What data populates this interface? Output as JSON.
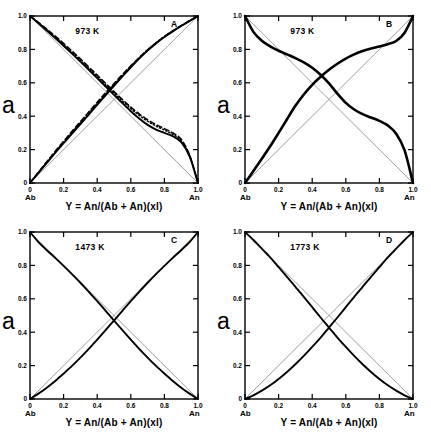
{
  "figure": {
    "background": "#ffffff",
    "axis_color": "#000000",
    "curve_color": "#000000",
    "ideal_line_color": "#888888"
  },
  "axes": {
    "y_label": "a",
    "x_title": "Y = An/(Ab + An)(xl)",
    "x_left_endmember": "Ab",
    "x_right_endmember": "An",
    "x_ticks": [
      "0",
      "0.2",
      "0.4",
      "0.6",
      "0.8",
      "1.0"
    ],
    "y_ticks": [
      "0",
      "0.2",
      "0.4",
      "0.6",
      "0.8",
      "1.0"
    ],
    "xlim": [
      0,
      1
    ],
    "ylim": [
      0,
      1
    ]
  },
  "panels": [
    {
      "id": "A",
      "label": "A",
      "temperature": "973 K"
    },
    {
      "id": "B",
      "label": "B",
      "temperature": "973 K"
    },
    {
      "id": "C",
      "label": "C",
      "temperature": "1473 K"
    },
    {
      "id": "D",
      "label": "D",
      "temperature": "1773 K"
    }
  ],
  "chart_data": [
    {
      "type": "line",
      "panel": "A",
      "title": "973 K",
      "xlabel": "Y = An/(Ab + An)(xl)",
      "ylabel": "a",
      "xlim": [
        0,
        1
      ],
      "ylim": [
        0,
        1
      ],
      "grid": false,
      "legend": "none",
      "annotations": [
        "A",
        "973 K",
        "Ab",
        "An"
      ],
      "series": [
        {
          "name": "a(An) solid",
          "style": "solid",
          "x": [
            0.0,
            0.05,
            0.1,
            0.15,
            0.2,
            0.25,
            0.3,
            0.35,
            0.4,
            0.45,
            0.5,
            0.55,
            0.6,
            0.65,
            0.7,
            0.75,
            0.8,
            0.85,
            0.9,
            0.95,
            1.0
          ],
          "y": [
            0.0,
            0.06,
            0.12,
            0.18,
            0.238,
            0.296,
            0.353,
            0.41,
            0.468,
            0.525,
            0.582,
            0.638,
            0.693,
            0.745,
            0.793,
            0.836,
            0.874,
            0.908,
            0.94,
            0.971,
            1.0
          ]
        },
        {
          "name": "a(An) dashed",
          "style": "dashed",
          "x": [
            0.0,
            0.05,
            0.1,
            0.15,
            0.2,
            0.25,
            0.3,
            0.35,
            0.4,
            0.45,
            0.5,
            0.55,
            0.6,
            0.65,
            0.7,
            0.75,
            0.8,
            0.85,
            0.9,
            0.95,
            1.0
          ],
          "y": [
            0.0,
            0.065,
            0.128,
            0.19,
            0.25,
            0.31,
            0.368,
            0.426,
            0.484,
            0.54,
            0.596,
            0.65,
            0.702,
            0.752,
            0.798,
            0.84,
            0.878,
            0.912,
            0.943,
            0.972,
            1.0
          ]
        },
        {
          "name": "a(An) dotted",
          "style": "dotted",
          "x": [
            0.0,
            0.05,
            0.1,
            0.15,
            0.2,
            0.25,
            0.3,
            0.35,
            0.4,
            0.45,
            0.5,
            0.55,
            0.6,
            0.65,
            0.7,
            0.75,
            0.8,
            0.85,
            0.9,
            0.95,
            1.0
          ],
          "y": [
            0.0,
            0.062,
            0.124,
            0.185,
            0.244,
            0.303,
            0.361,
            0.418,
            0.476,
            0.533,
            0.589,
            0.644,
            0.698,
            0.749,
            0.796,
            0.839,
            0.877,
            0.911,
            0.941,
            0.971,
            1.0
          ]
        },
        {
          "name": "a(Ab) solid",
          "style": "solid",
          "x": [
            0.0,
            0.05,
            0.1,
            0.15,
            0.2,
            0.25,
            0.3,
            0.35,
            0.4,
            0.45,
            0.5,
            0.55,
            0.6,
            0.65,
            0.7,
            0.75,
            0.8,
            0.85,
            0.9,
            0.95,
            1.0
          ],
          "y": [
            1.0,
            0.957,
            0.913,
            0.868,
            0.822,
            0.775,
            0.727,
            0.678,
            0.628,
            0.578,
            0.528,
            0.478,
            0.43,
            0.386,
            0.348,
            0.32,
            0.3,
            0.28,
            0.245,
            0.16,
            0.0
          ]
        },
        {
          "name": "a(Ab) dashed",
          "style": "dashed",
          "x": [
            0.0,
            0.05,
            0.1,
            0.15,
            0.2,
            0.25,
            0.3,
            0.35,
            0.4,
            0.45,
            0.5,
            0.55,
            0.6,
            0.65,
            0.7,
            0.75,
            0.8,
            0.85,
            0.9,
            0.95,
            1.0
          ],
          "y": [
            1.0,
            0.962,
            0.922,
            0.88,
            0.836,
            0.79,
            0.743,
            0.695,
            0.646,
            0.597,
            0.548,
            0.5,
            0.455,
            0.414,
            0.379,
            0.35,
            0.326,
            0.3,
            0.262,
            0.168,
            0.0
          ]
        },
        {
          "name": "a(Ab) dotted",
          "style": "dotted",
          "x": [
            0.0,
            0.05,
            0.1,
            0.15,
            0.2,
            0.25,
            0.3,
            0.35,
            0.4,
            0.45,
            0.5,
            0.55,
            0.6,
            0.65,
            0.7,
            0.75,
            0.8,
            0.85,
            0.9,
            0.95,
            1.0
          ],
          "y": [
            1.0,
            0.959,
            0.917,
            0.873,
            0.828,
            0.782,
            0.734,
            0.686,
            0.637,
            0.588,
            0.539,
            0.491,
            0.446,
            0.405,
            0.37,
            0.341,
            0.317,
            0.291,
            0.253,
            0.164,
            0.0
          ]
        },
        {
          "name": "ideal a(An)",
          "style": "ideal",
          "x": [
            0,
            1
          ],
          "y": [
            0,
            1
          ]
        },
        {
          "name": "ideal a(Ab)",
          "style": "ideal",
          "x": [
            0,
            1
          ],
          "y": [
            1,
            0
          ]
        }
      ]
    },
    {
      "type": "line",
      "panel": "B",
      "title": "973 K",
      "xlabel": "Y = An/(Ab + An)(xl)",
      "ylabel": "a",
      "xlim": [
        0,
        1
      ],
      "ylim": [
        0,
        1
      ],
      "grid": false,
      "legend": "none",
      "annotations": [
        "B",
        "973 K",
        "Ab",
        "An"
      ],
      "series": [
        {
          "name": "a(An) sigmoid",
          "style": "solid",
          "x": [
            0.0,
            0.05,
            0.1,
            0.15,
            0.2,
            0.25,
            0.3,
            0.35,
            0.4,
            0.45,
            0.5,
            0.55,
            0.6,
            0.65,
            0.7,
            0.75,
            0.8,
            0.85,
            0.9,
            0.95,
            1.0
          ],
          "y": [
            0.0,
            0.072,
            0.145,
            0.22,
            0.3,
            0.382,
            0.462,
            0.53,
            0.588,
            0.636,
            0.678,
            0.714,
            0.745,
            0.77,
            0.79,
            0.805,
            0.818,
            0.831,
            0.85,
            0.9,
            1.0
          ]
        },
        {
          "name": "a(Ab) sigmoid",
          "style": "solid",
          "x": [
            0.0,
            0.05,
            0.1,
            0.15,
            0.2,
            0.25,
            0.3,
            0.35,
            0.4,
            0.45,
            0.5,
            0.55,
            0.6,
            0.65,
            0.7,
            0.75,
            0.8,
            0.85,
            0.9,
            0.95,
            1.0
          ],
          "y": [
            1.0,
            0.905,
            0.852,
            0.818,
            0.792,
            0.77,
            0.748,
            0.722,
            0.69,
            0.648,
            0.596,
            0.535,
            0.48,
            0.44,
            0.412,
            0.392,
            0.372,
            0.345,
            0.295,
            0.195,
            0.0
          ]
        },
        {
          "name": "ideal a(An)",
          "style": "ideal",
          "x": [
            0,
            1
          ],
          "y": [
            0,
            1
          ]
        },
        {
          "name": "ideal a(Ab)",
          "style": "ideal",
          "x": [
            0,
            1
          ],
          "y": [
            1,
            0
          ]
        }
      ]
    },
    {
      "type": "line",
      "panel": "C",
      "title": "1473 K",
      "xlabel": "Y = An/(Ab + An)(xl)",
      "ylabel": "a",
      "xlim": [
        0,
        1
      ],
      "ylim": [
        0,
        1
      ],
      "grid": false,
      "legend": "none",
      "annotations": [
        "C",
        "1473 K",
        "Ab",
        "An"
      ],
      "series": [
        {
          "name": "a(An)",
          "style": "solid",
          "x": [
            0.0,
            0.05,
            0.1,
            0.15,
            0.2,
            0.25,
            0.3,
            0.35,
            0.4,
            0.45,
            0.5,
            0.55,
            0.6,
            0.65,
            0.7,
            0.75,
            0.8,
            0.85,
            0.9,
            0.95,
            1.0
          ],
          "y": [
            0.0,
            0.032,
            0.068,
            0.108,
            0.152,
            0.198,
            0.248,
            0.3,
            0.355,
            0.412,
            0.47,
            0.528,
            0.586,
            0.642,
            0.696,
            0.748,
            0.797,
            0.845,
            0.891,
            0.94,
            1.0
          ]
        },
        {
          "name": "a(Ab)",
          "style": "solid",
          "x": [
            0.0,
            0.05,
            0.1,
            0.15,
            0.2,
            0.25,
            0.3,
            0.35,
            0.4,
            0.45,
            0.5,
            0.55,
            0.6,
            0.65,
            0.7,
            0.75,
            0.8,
            0.85,
            0.9,
            0.95,
            1.0
          ],
          "y": [
            1.0,
            0.94,
            0.891,
            0.845,
            0.797,
            0.748,
            0.696,
            0.642,
            0.586,
            0.528,
            0.47,
            0.412,
            0.355,
            0.3,
            0.248,
            0.198,
            0.152,
            0.108,
            0.068,
            0.032,
            0.0
          ]
        },
        {
          "name": "ideal a(An)",
          "style": "ideal",
          "x": [
            0,
            1
          ],
          "y": [
            0,
            1
          ]
        },
        {
          "name": "ideal a(Ab)",
          "style": "ideal",
          "x": [
            0,
            1
          ],
          "y": [
            1,
            0
          ]
        }
      ]
    },
    {
      "type": "line",
      "panel": "D",
      "title": "1773 K",
      "xlabel": "Y = An/(Ab + An)(xl)",
      "ylabel": "a",
      "xlim": [
        0,
        1
      ],
      "ylim": [
        0,
        1
      ],
      "grid": false,
      "legend": "none",
      "annotations": [
        "D",
        "1773 K",
        "Ab",
        "An"
      ],
      "series": [
        {
          "name": "a(An)",
          "style": "solid",
          "x": [
            0.0,
            0.05,
            0.1,
            0.15,
            0.2,
            0.25,
            0.3,
            0.35,
            0.4,
            0.45,
            0.5,
            0.55,
            0.6,
            0.65,
            0.7,
            0.75,
            0.8,
            0.85,
            0.9,
            0.95,
            1.0
          ],
          "y": [
            0.0,
            0.022,
            0.05,
            0.082,
            0.12,
            0.162,
            0.208,
            0.258,
            0.312,
            0.368,
            0.428,
            0.488,
            0.55,
            0.612,
            0.672,
            0.732,
            0.79,
            0.848,
            0.9,
            0.952,
            1.0
          ]
        },
        {
          "name": "a(Ab)",
          "style": "solid",
          "x": [
            0.0,
            0.05,
            0.1,
            0.15,
            0.2,
            0.25,
            0.3,
            0.35,
            0.4,
            0.45,
            0.5,
            0.55,
            0.6,
            0.65,
            0.7,
            0.75,
            0.8,
            0.85,
            0.9,
            0.95,
            1.0
          ],
          "y": [
            1.0,
            0.952,
            0.9,
            0.848,
            0.79,
            0.732,
            0.672,
            0.612,
            0.55,
            0.488,
            0.428,
            0.368,
            0.312,
            0.258,
            0.208,
            0.162,
            0.12,
            0.082,
            0.05,
            0.022,
            0.0
          ]
        },
        {
          "name": "ideal a(An)",
          "style": "ideal",
          "x": [
            0,
            1
          ],
          "y": [
            0,
            1
          ]
        },
        {
          "name": "ideal a(Ab)",
          "style": "ideal",
          "x": [
            0,
            1
          ],
          "y": [
            1,
            0
          ]
        }
      ]
    }
  ]
}
